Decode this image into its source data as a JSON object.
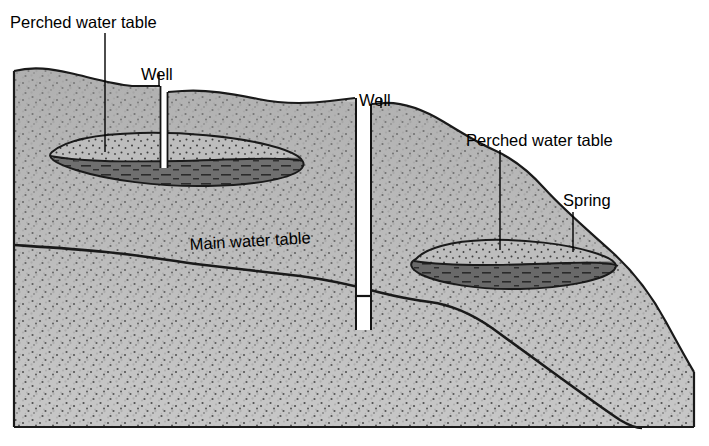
{
  "figure": {
    "type": "geological-cross-section",
    "width": 709,
    "height": 446
  },
  "labels": {
    "perched_water_table_left": "Perched water table",
    "well_left": "Well",
    "well_right": "Well",
    "perched_water_table_right": "Perched water table",
    "spring": "Spring",
    "main_water_table": "Main water table"
  },
  "colors": {
    "background": "#ffffff",
    "sand_fill": "#c9c9c9",
    "sand_stipple": "#3a3a3a",
    "perched_lens_upper": "#b0b0b0",
    "perched_lens_lower": "#6f6f6f",
    "outline": "#141414",
    "label_text": "#000000",
    "well_shaft": "#ffffff"
  },
  "features": [
    {
      "name": "ground-surface",
      "kind": "terrain-outline",
      "description": "Hilly land surface sloping down left to right"
    },
    {
      "name": "main-water-table",
      "kind": "water-table-line",
      "description": "Regional water table sloping down to the right"
    },
    {
      "name": "perched-lens-left",
      "kind": "perched-aquifer",
      "description": "Lens-shaped perched water body with impermeable clay base"
    },
    {
      "name": "perched-lens-right",
      "kind": "perched-aquifer",
      "description": "Lens-shaped perched water body discharging at a spring"
    },
    {
      "name": "well-left",
      "kind": "well-shaft",
      "description": "Shallow well terminating in the left perched aquifer"
    },
    {
      "name": "well-right",
      "kind": "well-shaft",
      "description": "Deep well reaching the main water table"
    },
    {
      "name": "spring",
      "kind": "discharge-point",
      "description": "Spring where perched water table intersects hillside"
    }
  ]
}
